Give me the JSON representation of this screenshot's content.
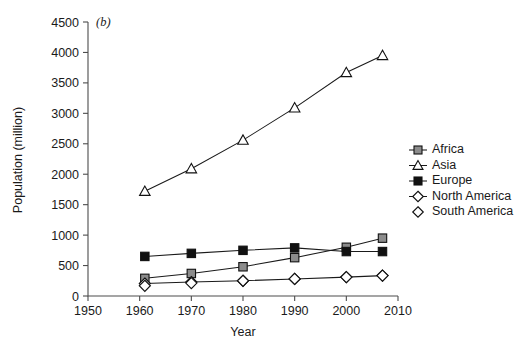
{
  "panel": {
    "label": "(b)"
  },
  "chart_data": {
    "type": "line",
    "title": "",
    "xlabel": "Year",
    "ylabel": "Population (million)",
    "xlim": [
      1950,
      2010
    ],
    "ylim": [
      0,
      4500
    ],
    "xticks": [
      1950,
      1960,
      1970,
      1980,
      1990,
      2000,
      2010
    ],
    "yticks": [
      0,
      500,
      1000,
      1500,
      2000,
      2500,
      3000,
      3500,
      4000,
      4500
    ],
    "grid": false,
    "legend_position": "right",
    "x": [
      1961,
      1970,
      1980,
      1990,
      2000,
      2007
    ],
    "series": [
      {
        "name": "Africa",
        "marker": "square-gray",
        "line": true,
        "values": [
          290,
          370,
          480,
          630,
          800,
          950
        ]
      },
      {
        "name": "Asia",
        "marker": "triangle-open",
        "line": true,
        "values": [
          1720,
          2090,
          2560,
          3090,
          3670,
          3950
        ]
      },
      {
        "name": "Europe",
        "marker": "square-filled",
        "line": true,
        "values": [
          650,
          700,
          750,
          790,
          730,
          730
        ]
      },
      {
        "name": "North America",
        "marker": "diamond-open",
        "line": true,
        "values": [
          205,
          230,
          250,
          280,
          310,
          335
        ]
      },
      {
        "name": "South America",
        "marker": "diamond-open",
        "line": false,
        "values": [
          168,
          212,
          250,
          280,
          310,
          335
        ]
      }
    ]
  },
  "legend": {
    "items": [
      {
        "label": "Africa",
        "marker": "square-gray",
        "rule": true
      },
      {
        "label": "Asia",
        "marker": "triangle-open",
        "rule": true
      },
      {
        "label": "Europe",
        "marker": "square-filled",
        "rule": true
      },
      {
        "label": "North America",
        "marker": "diamond-open",
        "rule": true
      },
      {
        "label": "South America",
        "marker": "diamond-open",
        "rule": false
      }
    ]
  },
  "colors": {
    "axis": "#4d4d4d",
    "line": "#1a1a1a",
    "marker_gray": "#8c8c8c",
    "marker_black": "#111111",
    "marker_open": "#ffffff",
    "text": "#1a1a1a",
    "background": "#ffffff"
  }
}
